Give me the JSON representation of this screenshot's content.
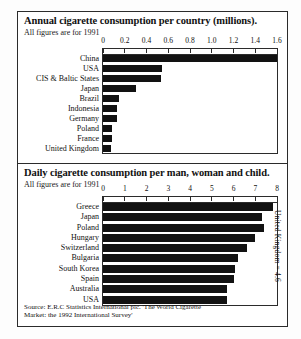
{
  "chart_data": [
    {
      "type": "bar",
      "orientation": "horizontal",
      "title": "Annual cigarette consumption per country (millions).",
      "subtitle": "All figures are for 1991",
      "xlabel": "",
      "ylabel": "",
      "xlim": [
        0,
        1.6
      ],
      "xticks": [
        "0",
        "0.2",
        "0.4",
        "0.6",
        "0.8",
        "1.0",
        "1.2",
        "1.4",
        "1.6"
      ],
      "xtick_values": [
        0,
        0.2,
        0.4,
        0.6,
        0.8,
        1.0,
        1.2,
        1.4,
        1.6
      ],
      "grid": false,
      "legend": "none",
      "categories": [
        "China",
        "USA",
        "CIS & Baltic States",
        "Japan",
        "Brazil",
        "Indonesia",
        "Germany",
        "Poland",
        "France",
        "United Kingdom"
      ],
      "values": [
        1.6,
        0.545,
        0.53,
        0.3,
        0.145,
        0.13,
        0.13,
        0.085,
        0.08,
        0.075
      ]
    },
    {
      "type": "bar",
      "orientation": "horizontal",
      "title": "Daily cigarette consumption per man, woman and child.",
      "subtitle": "All figures are for 1991",
      "xlabel": "",
      "ylabel": "",
      "xlim": [
        0,
        8
      ],
      "xticks": [
        "0",
        "1",
        "2",
        "3",
        "4",
        "5",
        "6",
        "7",
        "8"
      ],
      "xtick_values": [
        0,
        1,
        2,
        3,
        4,
        5,
        6,
        7,
        8
      ],
      "grid": false,
      "legend": "none",
      "categories": [
        "Greece",
        "Japan",
        "Poland",
        "Hungary",
        "Switzerland",
        "Bulgaria",
        "South Korea",
        "Spain",
        "Australia",
        "USA"
      ],
      "values": [
        7.8,
        7.3,
        7.4,
        7.0,
        6.6,
        6.2,
        6.05,
        6.0,
        5.7,
        5.7
      ],
      "annotation": "United Kingdom = 4.6"
    }
  ],
  "source": {
    "line1": "Source: E.R.C Statistics International plc. 'The World Cigarette",
    "line2": "Market: the 1992 International Survey'"
  },
  "colors": {
    "bar": "#121212",
    "frame": "#2b2b2b",
    "background": "#ffffff"
  }
}
